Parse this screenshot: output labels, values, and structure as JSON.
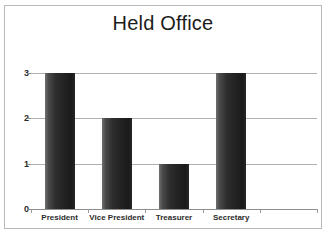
{
  "chart_data": {
    "type": "bar",
    "title": "Held Office",
    "xlabel": "",
    "ylabel": "",
    "categories": [
      "President",
      "Vice President",
      "Treasurer",
      "Secretary",
      ""
    ],
    "values": [
      3,
      2,
      1,
      3,
      0
    ],
    "ylim": [
      0,
      3
    ],
    "yticks": [
      "0",
      "1",
      "2",
      "3"
    ],
    "grid": true,
    "legend": false,
    "bar_color": "#262626",
    "gridline_color": "#b0b0b0",
    "axis_color": "#8d8d8d",
    "frame_color": "#b9b9b9",
    "background": "#ffffff",
    "title_color": "#1c1c1c"
  }
}
